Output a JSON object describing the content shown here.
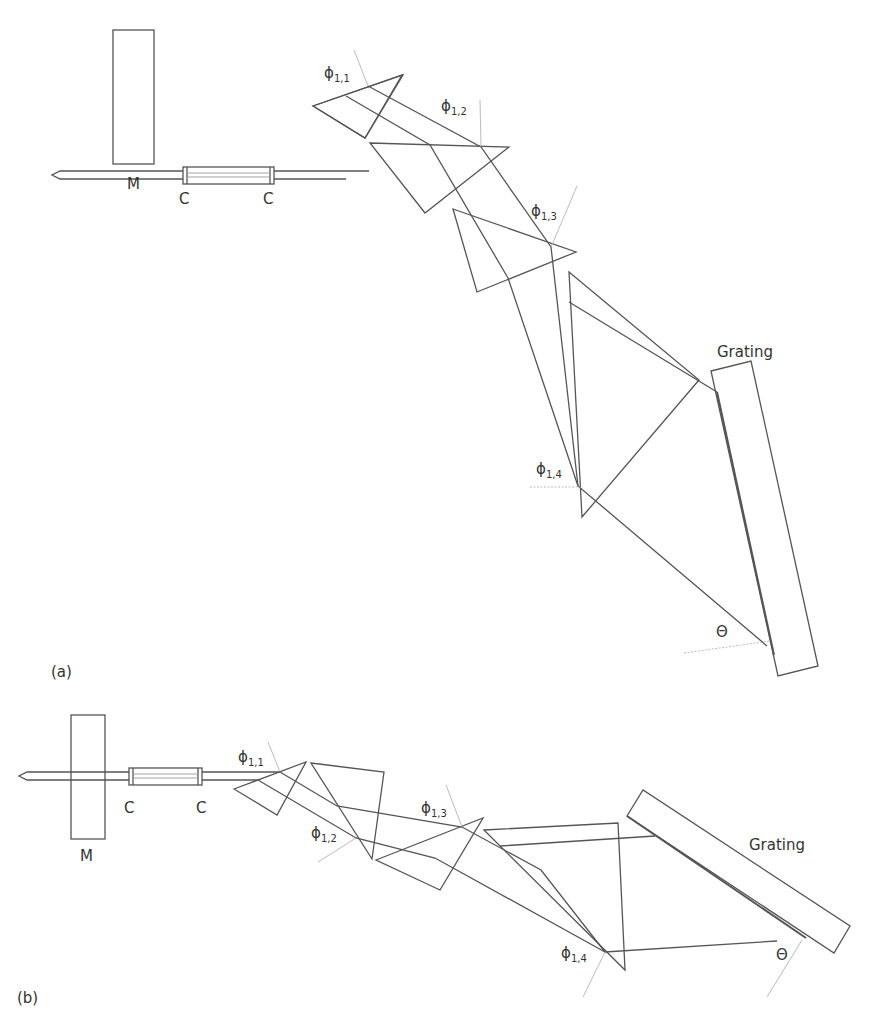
{
  "figure": {
    "panels": [
      {
        "id": "a",
        "label": "(a)",
        "components": {
          "mirror": "M",
          "cell_left": "C",
          "cell_right": "C",
          "grating": "Grating"
        },
        "angles": {
          "phi_1_1": {
            "symbol": "ϕ",
            "sub": "1,1"
          },
          "phi_1_2": {
            "symbol": "ϕ",
            "sub": "1,2"
          },
          "phi_1_3": {
            "symbol": "ϕ",
            "sub": "1,3"
          },
          "phi_1_4": {
            "symbol": "ϕ",
            "sub": "1,4"
          },
          "theta": "Θ"
        },
        "prism_count": 4,
        "layout": "curved (beam bends downward through prisms to a near-vertical grating)"
      },
      {
        "id": "b",
        "label": "(b)",
        "components": {
          "mirror": "M",
          "cell_left": "C",
          "cell_right": "C",
          "grating": "Grating"
        },
        "angles": {
          "phi_1_1": {
            "symbol": "ϕ",
            "sub": "1,1"
          },
          "phi_1_2": {
            "symbol": "ϕ",
            "sub": "1,2"
          },
          "phi_1_3": {
            "symbol": "ϕ",
            "sub": "1,3"
          },
          "phi_1_4": {
            "symbol": "ϕ",
            "sub": "1,4"
          },
          "theta": "Θ"
        },
        "prism_count": 4,
        "layout": "compact (alternating prism orientation, beam zig-zags to a tilted grating)"
      }
    ],
    "colors": {
      "line": "#555555",
      "normal": "#aaaaaa",
      "text": "#333333",
      "background": "#ffffff"
    }
  }
}
